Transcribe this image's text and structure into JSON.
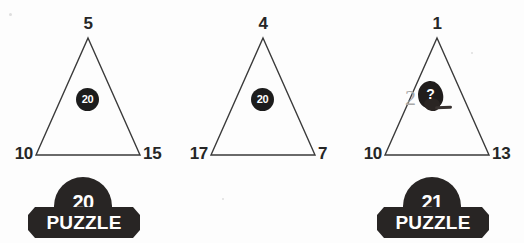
{
  "page": {
    "background_color": "#ffffff",
    "ink_color": "#262626",
    "badge_color": "#282524"
  },
  "puzzles": [
    {
      "id": "puzzle-20",
      "apex": "5",
      "bottom_left": "10",
      "bottom_right": "15",
      "center_value": "20",
      "center_kind": "disc",
      "badge": {
        "number": "20",
        "label": "PUZZLE",
        "visible": true
      }
    },
    {
      "id": "puzzle-middle",
      "apex": "4",
      "bottom_left": "17",
      "bottom_right": "7",
      "center_value": "20",
      "center_kind": "disc",
      "badge": {
        "number": "",
        "label": "",
        "visible": false
      }
    },
    {
      "id": "puzzle-21",
      "apex": "1",
      "bottom_left": "10",
      "bottom_right": "13",
      "center_value": "2",
      "center_unknown": "?",
      "center_kind": "scribble",
      "badge": {
        "number": "21",
        "label": "PUZZLE",
        "visible": true
      }
    }
  ]
}
